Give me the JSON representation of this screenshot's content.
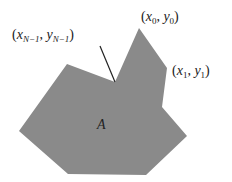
{
  "figure": {
    "area_label": "A",
    "polygon_fill": "#8a8a8a",
    "leader_color": "#222222",
    "vertex_labels": {
      "v0": {
        "var_x": "x",
        "sub_x": "0",
        "var_y": "y",
        "sub_y": "0"
      },
      "v1": {
        "var_x": "x",
        "sub_x": "1",
        "var_y": "y",
        "sub_y": "1"
      },
      "vN1": {
        "var_x": "x",
        "sub_x": "N−1",
        "var_y": "y",
        "sub_y": "N−1"
      }
    },
    "polygon_points": [
      [
        139,
        28
      ],
      [
        167,
        68
      ],
      [
        162,
        107
      ],
      [
        187,
        136
      ],
      [
        146,
        175
      ],
      [
        68,
        174
      ],
      [
        19,
        131
      ],
      [
        67,
        64
      ],
      [
        115,
        82
      ]
    ]
  }
}
